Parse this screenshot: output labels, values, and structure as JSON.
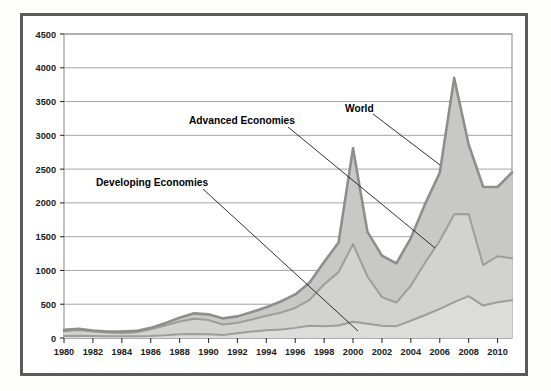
{
  "figure": {
    "name": "stacked-area-chart",
    "frame_color": "#5a5a5a",
    "plot_background": "#ffffff",
    "gridline_color": "#9a9a9a"
  },
  "chart_data": {
    "type": "area",
    "title": "",
    "subtitle": "",
    "xlabel": "",
    "ylabel": "",
    "stacked": true,
    "grid": true,
    "legend_position": "inline-annotations",
    "xlim": [
      1980,
      2011
    ],
    "ylim": [
      0,
      4500
    ],
    "ytick_step": 500,
    "yticks": [
      0,
      500,
      1000,
      1500,
      2000,
      2500,
      3000,
      3500,
      4000,
      4500
    ],
    "ytick_labels": [
      "0",
      "500",
      "1000",
      "1500",
      "2000",
      "2500",
      "3000",
      "3500",
      "4000",
      "4500"
    ],
    "xticks": [
      1980,
      1982,
      1984,
      1986,
      1988,
      1990,
      1992,
      1994,
      1996,
      1998,
      2000,
      2002,
      2004,
      2006,
      2008,
      2010
    ],
    "xtick_labels": [
      "1980",
      "1982",
      "1984",
      "1986",
      "1988",
      "1990",
      "1992",
      "1994",
      "1996",
      "1998",
      "2000",
      "2002",
      "2004",
      "2006",
      "2008",
      "2010"
    ],
    "x": [
      1980,
      1981,
      1982,
      1983,
      1984,
      1985,
      1986,
      1987,
      1988,
      1989,
      1990,
      1991,
      1992,
      1993,
      1994,
      1995,
      1996,
      1997,
      1998,
      1999,
      2000,
      2001,
      2002,
      2003,
      2004,
      2005,
      2006,
      2007,
      2008,
      2009,
      2010,
      2011
    ],
    "series": [
      {
        "name": "Developing Economies",
        "fill_color": "#dcdcda",
        "line_color": "#9d9d9b",
        "values": [
          30,
          35,
          30,
          25,
          25,
          25,
          30,
          40,
          55,
          60,
          55,
          45,
          70,
          95,
          115,
          125,
          150,
          180,
          175,
          185,
          240,
          210,
          180,
          175,
          255,
          340,
          430,
          530,
          620,
          480,
          530,
          560
        ]
      },
      {
        "name": "Advanced Economies",
        "fill_color": "#d2d2cf",
        "line_color": "#9d9d9b",
        "values": [
          70,
          85,
          65,
          55,
          50,
          60,
          100,
          145,
          190,
          225,
          210,
          155,
          155,
          180,
          215,
          250,
          295,
          385,
          620,
          790,
          1150,
          700,
          425,
          350,
          520,
          780,
          1010,
          1300,
          1215,
          600,
          680,
          620
        ]
      },
      {
        "name": "World",
        "fill_color": "#c8c8c5",
        "line_color": "#8e8e8c",
        "values": [
          20,
          15,
          15,
          15,
          20,
          20,
          20,
          35,
          55,
          80,
          85,
          90,
          95,
          110,
          125,
          165,
          200,
          255,
          330,
          440,
          1420,
          660,
          615,
          580,
          705,
          870,
          1005,
          2020,
          1030,
          1160,
          1025,
          1270
        ]
      }
    ],
    "cumulative": {
      "developing": [
        30,
        35,
        30,
        25,
        25,
        25,
        30,
        40,
        55,
        60,
        55,
        45,
        70,
        95,
        115,
        125,
        150,
        180,
        175,
        185,
        240,
        210,
        180,
        175,
        255,
        340,
        430,
        530,
        620,
        480,
        530,
        560
      ],
      "advanced": [
        100,
        120,
        95,
        80,
        75,
        85,
        130,
        185,
        245,
        285,
        265,
        200,
        225,
        275,
        330,
        375,
        445,
        565,
        795,
        975,
        1390,
        910,
        605,
        525,
        775,
        1120,
        1440,
        1830,
        1835,
        1080,
        1210,
        1180
      ],
      "world": [
        120,
        135,
        110,
        95,
        95,
        105,
        150,
        220,
        300,
        365,
        350,
        290,
        320,
        385,
        455,
        540,
        645,
        820,
        1125,
        1415,
        2810,
        1570,
        1220,
        1105,
        1480,
        1990,
        2445,
        3850,
        2865,
        2240,
        2235,
        2450
      ]
    },
    "annotations": [
      {
        "label": "World",
        "label_x": 345,
        "label_y": 112,
        "leader_from_x": 373,
        "leader_from_y": 114,
        "leader_to_x": 440,
        "leader_to_y": 165
      },
      {
        "label": "Advanced Economies",
        "label_x": 189,
        "label_y": 124,
        "leader_from_x": 288,
        "leader_from_y": 127,
        "leader_to_x": 435,
        "leader_to_y": 248
      },
      {
        "label": "Developing Economies",
        "label_x": 96,
        "label_y": 186,
        "leader_from_x": 203,
        "leader_from_y": 189,
        "leader_to_x": 358,
        "leader_to_y": 331
      }
    ]
  }
}
